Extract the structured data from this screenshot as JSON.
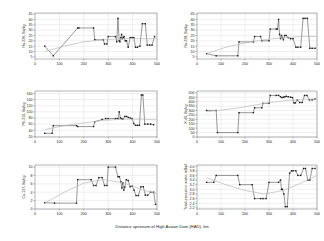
{
  "figure": {
    "shared_xlabel": "Distance upstream of High Aswan Dam (HAD), km",
    "background": "#ffffff",
    "line_color": "#1a1a1a",
    "marker_color": "#1a1a1a",
    "trend_color": "#b9b9b9",
    "grid_color": "#d9d9d9",
    "axis_color": "#6e6e6e"
  },
  "chart_data": [
    {
      "id": "ra226",
      "type": "line",
      "title": "",
      "xlabel": "Distance upstream of High Aswan Dam (HAD), km",
      "ylabel": "Ra-226, Bq/kg",
      "xlim": [
        0,
        500
      ],
      "ylim": [
        3,
        46
      ],
      "xticks": [
        0,
        100,
        200,
        300,
        400,
        500
      ],
      "yticks": [
        5,
        10,
        15,
        20,
        25,
        30,
        35,
        40,
        45
      ],
      "grid": true,
      "legend": "none",
      "series": [
        {
          "name": "Ra-226 in sediment",
          "x": [
            40,
            75,
            175,
            180,
            240,
            245,
            280,
            285,
            295,
            300,
            330,
            335,
            340,
            345,
            348,
            352,
            355,
            358,
            362,
            365,
            370,
            375,
            382,
            390,
            398,
            405,
            412,
            420,
            430,
            440,
            452,
            460,
            470,
            480,
            490
          ],
          "values": [
            15,
            6,
            32,
            32,
            32,
            21,
            21,
            17,
            17,
            24,
            24,
            19,
            41,
            20,
            19,
            23,
            26,
            22,
            23,
            24,
            20,
            20,
            14,
            23,
            23,
            23,
            14,
            14,
            15,
            36,
            36,
            16,
            16,
            16,
            24
          ]
        },
        {
          "name": "Trend",
          "x": [
            40,
            120,
            200,
            280,
            360,
            440,
            500
          ],
          "values": [
            10,
            15,
            19,
            21,
            22,
            22,
            22
          ]
        }
      ]
    },
    {
      "id": "ra228",
      "type": "line",
      "title": "",
      "xlabel": "Distance upstream of High Aswan Dam (HAD), km",
      "ylabel": "Ra-228, Bq/kg",
      "xlim": [
        0,
        500
      ],
      "ylim": [
        3,
        46
      ],
      "xticks": [
        0,
        100,
        200,
        300,
        400,
        500
      ],
      "yticks": [
        5,
        10,
        15,
        20,
        25,
        30,
        35,
        40,
        45
      ],
      "grid": true,
      "legend": "none",
      "series": [
        {
          "name": "Ra-228 in sediment",
          "x": [
            40,
            80,
            170,
            175,
            235,
            240,
            265,
            270,
            300,
            305,
            330,
            335,
            340,
            344,
            348,
            352,
            356,
            360,
            365,
            372,
            380,
            390,
            400,
            412,
            420,
            432,
            442,
            450,
            460,
            470,
            480,
            492
          ],
          "values": [
            8,
            6,
            6,
            19,
            19,
            24,
            24,
            20,
            20,
            31,
            31,
            31,
            40,
            26,
            22,
            25,
            23,
            21,
            25,
            25,
            23,
            22,
            22,
            14,
            14,
            14,
            41,
            41,
            41,
            13,
            13,
            13
          ]
        },
        {
          "name": "Trend",
          "x": [
            40,
            120,
            200,
            280,
            360,
            440,
            500
          ],
          "values": [
            8,
            14,
            18,
            21,
            23,
            24,
            24
          ]
        }
      ]
    },
    {
      "id": "pb210",
      "type": "line",
      "title": "",
      "xlabel": "Distance upstream of High Aswan Dam (HAD), km",
      "ylabel": "Pb-210, Bq/kg",
      "xlim": [
        0,
        500
      ],
      "ylim": [
        18,
        168
      ],
      "xticks": [
        0,
        100,
        200,
        300,
        400,
        500
      ],
      "yticks": [
        20,
        40,
        60,
        80,
        100,
        120,
        140,
        160
      ],
      "grid": true,
      "legend": "none",
      "series": [
        {
          "name": "Pb-210 in sediment",
          "x": [
            40,
            70,
            75,
            170,
            175,
            240,
            245,
            275,
            290,
            300,
            330,
            340,
            345,
            350,
            355,
            360,
            368,
            375,
            382,
            390,
            398,
            405,
            412,
            420,
            428,
            436,
            442,
            450,
            462,
            474,
            486
          ],
          "values": [
            30,
            30,
            55,
            55,
            52,
            52,
            68,
            75,
            78,
            78,
            78,
            78,
            100,
            80,
            78,
            76,
            85,
            85,
            82,
            80,
            78,
            62,
            56,
            56,
            56,
            155,
            155,
            60,
            60,
            60,
            58
          ]
        },
        {
          "name": "Trend",
          "x": [
            40,
            120,
            200,
            280,
            360,
            440,
            500
          ],
          "values": [
            42,
            55,
            64,
            72,
            76,
            76,
            74
          ]
        }
      ]
    },
    {
      "id": "k40",
      "type": "line",
      "title": "",
      "xlabel": "Distance upstream of High Aswan Dam (HAD), km",
      "ylabel": "K-40, Bq/kg",
      "xlim": [
        0,
        500
      ],
      "ylim": [
        0,
        520
      ],
      "xticks": [
        0,
        100,
        200,
        300,
        400,
        500
      ],
      "yticks": [
        0,
        50,
        100,
        150,
        200,
        250,
        300,
        350,
        400,
        450,
        500
      ],
      "grid": true,
      "legend": "none",
      "series": [
        {
          "name": "K-40 in sediment",
          "x": [
            40,
            80,
            85,
            170,
            175,
            235,
            240,
            270,
            275,
            300,
            305,
            330,
            340,
            348,
            354,
            360,
            366,
            372,
            380,
            390,
            398,
            404,
            410,
            418,
            428,
            438,
            448,
            458,
            468,
            480,
            492
          ],
          "values": [
            300,
            300,
            50,
            50,
            275,
            275,
            330,
            330,
            380,
            380,
            470,
            470,
            470,
            455,
            445,
            450,
            455,
            460,
            455,
            450,
            445,
            385,
            385,
            420,
            390,
            390,
            470,
            470,
            420,
            420,
            430
          ]
        },
        {
          "name": "Trend",
          "x": [
            40,
            120,
            200,
            280,
            360,
            440,
            500
          ],
          "values": [
            285,
            310,
            340,
            380,
            410,
            425,
            430
          ]
        }
      ]
    },
    {
      "id": "cs137",
      "type": "line",
      "title": "",
      "xlabel": "Distance upstream of High Aswan Dam (HAD), km",
      "ylabel": "Cs-137, Bq/kg",
      "xlim": [
        0,
        500
      ],
      "ylim": [
        0,
        10.5
      ],
      "xticks": [
        0,
        100,
        200,
        300,
        400,
        500
      ],
      "yticks": [
        0,
        2,
        4,
        6,
        8,
        10
      ],
      "grid": true,
      "legend": "none",
      "series": [
        {
          "name": "Cs-137 in sediment",
          "x": [
            40,
            80,
            170,
            175,
            230,
            240,
            250,
            262,
            275,
            285,
            295,
            300,
            330,
            340,
            346,
            352,
            356,
            360,
            364,
            368,
            374,
            382,
            390,
            398,
            406,
            414,
            424,
            434,
            444,
            452,
            462,
            474,
            486,
            494
          ],
          "values": [
            1.5,
            1.4,
            1.4,
            7.0,
            7.0,
            5.6,
            5.6,
            7.5,
            7.5,
            5.6,
            5.6,
            10.0,
            10.0,
            7.7,
            7.7,
            6.5,
            5.0,
            6.3,
            4.5,
            5.2,
            7.0,
            6.8,
            5.3,
            5.5,
            4.5,
            3.2,
            3.2,
            5.3,
            5.3,
            3.3,
            3.3,
            4.0,
            4.0,
            1.1
          ]
        },
        {
          "name": "Trend",
          "x": [
            40,
            120,
            200,
            280,
            360,
            440,
            500
          ],
          "values": [
            1.4,
            4.0,
            6.2,
            7.0,
            6.3,
            4.6,
            3.6
          ]
        }
      ]
    },
    {
      "id": "uranium",
      "type": "line",
      "title": "",
      "xlabel": "Distance upstream of High Aswan Dam (HAD), km",
      "ylabel": "Total uranium in water, mBq/l",
      "xlim": [
        0,
        500
      ],
      "ylim": [
        2.15,
        4.05
      ],
      "xticks": [
        0,
        100,
        200,
        300,
        400,
        500
      ],
      "yticks": [
        2.2,
        2.4,
        2.6,
        2.8,
        3.0,
        3.2,
        3.4,
        3.6,
        3.8,
        4.0
      ],
      "ytick_labels": [
        "2.2",
        "2.4",
        "2.6",
        "2.8",
        "3.0",
        "3.2",
        "3.4",
        "3.6",
        "3.8",
        "4.0"
      ],
      "grid": true,
      "legend": "none",
      "series": [
        {
          "name": "Total uranium in water",
          "x": [
            40,
            70,
            80,
            170,
            178,
            230,
            240,
            265,
            275,
            288,
            300,
            340,
            348,
            352,
            356,
            362,
            368,
            376,
            386,
            394,
            400,
            412,
            420,
            432,
            444,
            452,
            462,
            470,
            480,
            492
          ],
          "values": [
            3.3,
            3.3,
            3.6,
            3.6,
            3.2,
            3.2,
            2.6,
            2.6,
            2.6,
            2.6,
            3.3,
            3.3,
            3.4,
            3.0,
            3.0,
            2.8,
            2.25,
            2.25,
            3.7,
            3.8,
            3.8,
            3.8,
            3.6,
            3.6,
            3.9,
            3.9,
            3.4,
            3.4,
            3.9,
            3.9
          ]
        },
        {
          "name": "Trend",
          "x": [
            40,
            120,
            200,
            280,
            360,
            440,
            500
          ],
          "values": [
            3.5,
            3.2,
            2.95,
            2.8,
            2.95,
            3.3,
            3.6
          ]
        }
      ]
    }
  ]
}
